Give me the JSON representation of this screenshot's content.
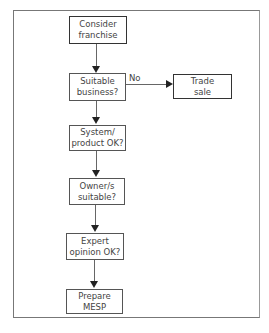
{
  "diagram": {
    "type": "flowchart",
    "nodes": [
      {
        "id": "consider",
        "line1": "Consider",
        "line2": "franchise",
        "emphasis": true
      },
      {
        "id": "suitable_business",
        "line1": "Suitable",
        "line2": "business?",
        "emphasis": false
      },
      {
        "id": "trade_sale",
        "line1": "Trade",
        "line2": "sale",
        "emphasis": true
      },
      {
        "id": "system_product",
        "line1": "System/",
        "line2": "product OK?",
        "emphasis": false
      },
      {
        "id": "owner_suitable",
        "line1": "Owner/s",
        "line2": "suitable?",
        "emphasis": false
      },
      {
        "id": "expert_opinion",
        "line1": "Expert",
        "line2": "opinion OK?",
        "emphasis": false
      },
      {
        "id": "prepare_mesp",
        "line1": "Prepare",
        "line2": "MESP",
        "emphasis": false
      }
    ],
    "edges": [
      {
        "from": "consider",
        "to": "suitable_business",
        "label": ""
      },
      {
        "from": "suitable_business",
        "to": "trade_sale",
        "label": "No"
      },
      {
        "from": "suitable_business",
        "to": "system_product",
        "label": ""
      },
      {
        "from": "system_product",
        "to": "owner_suitable",
        "label": ""
      },
      {
        "from": "owner_suitable",
        "to": "expert_opinion",
        "label": ""
      },
      {
        "from": "expert_opinion",
        "to": "prepare_mesp",
        "label": ""
      }
    ],
    "no_label": "No"
  }
}
